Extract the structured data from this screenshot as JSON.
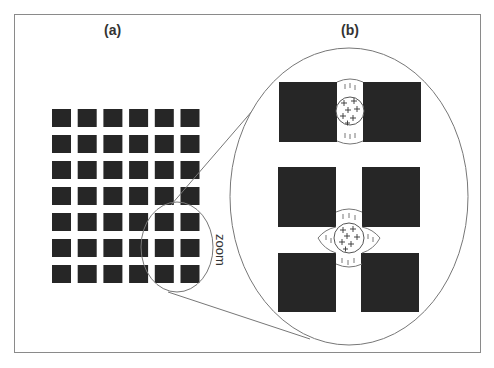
{
  "labels": {
    "panel_a": "(a)",
    "panel_b": "(b)",
    "zoom": "zoom"
  },
  "panel_a": {
    "grid_columns": 6,
    "grid_rows": 7,
    "square_color": "#262626"
  },
  "panel_b": {
    "square_color": "#262626",
    "charge_plus": "+",
    "charge_minus": "|"
  },
  "colors": {
    "line": "#777777",
    "frame": "#8a8a8a",
    "background": "#ffffff"
  }
}
